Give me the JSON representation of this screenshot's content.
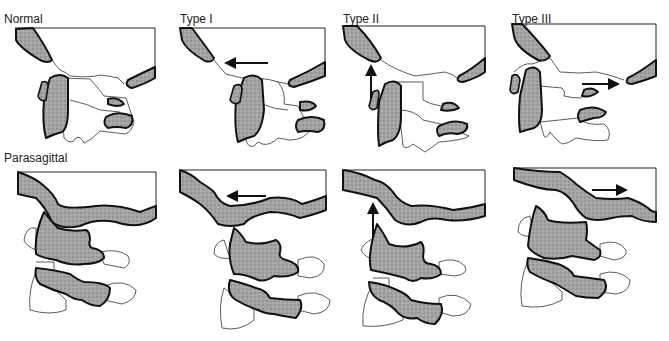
{
  "figure": {
    "rows": [
      {
        "row_label": "",
        "panels": [
          {
            "label": "Normal",
            "arrow": "none"
          },
          {
            "label": "Type I",
            "arrow": "left"
          },
          {
            "label": "Type II",
            "arrow": "up"
          },
          {
            "label": "Type III",
            "arrow": "right"
          }
        ]
      },
      {
        "row_label": "Parasagittal",
        "panels": [
          {
            "label": "",
            "arrow": "none"
          },
          {
            "label": "",
            "arrow": "left"
          },
          {
            "label": "",
            "arrow": "up"
          },
          {
            "label": "",
            "arrow": "right"
          }
        ]
      }
    ],
    "colors": {
      "bone_fill": "#9a9a9a",
      "outline": "#111111",
      "background": "#ffffff"
    }
  }
}
